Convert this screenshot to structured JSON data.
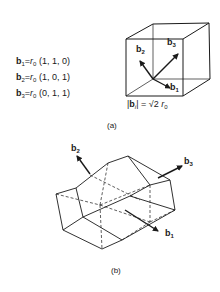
{
  "figure": {
    "part_a": {
      "caption": "(a)",
      "definitions": [
        {
          "vector": "b",
          "index": "1",
          "equals": "=",
          "scale": "r",
          "scale_sub": "0",
          "components": "(1, 1, 0)"
        },
        {
          "vector": "b",
          "index": "2",
          "equals": "=",
          "scale": "r",
          "scale_sub": "0",
          "components": "(1, 0, 1)"
        },
        {
          "vector": "b",
          "index": "3",
          "equals": "=",
          "scale": "r",
          "scale_sub": "0",
          "components": "(0, 1, 1)"
        }
      ],
      "cube_vectors": [
        {
          "vector": "b",
          "index": "1"
        },
        {
          "vector": "b",
          "index": "2"
        },
        {
          "vector": "b",
          "index": "3"
        }
      ],
      "norm_label": {
        "left": "|",
        "vector": "b",
        "index": "i",
        "right": "| = √2 ",
        "scale": "r",
        "scale_sub": "0"
      }
    },
    "part_b": {
      "caption": "(b)",
      "vectors": [
        {
          "vector": "b",
          "index": "1"
        },
        {
          "vector": "b",
          "index": "2"
        },
        {
          "vector": "b",
          "index": "3"
        }
      ]
    },
    "colors": {
      "ink": "#1a1a1a",
      "background": "#ffffff"
    }
  }
}
